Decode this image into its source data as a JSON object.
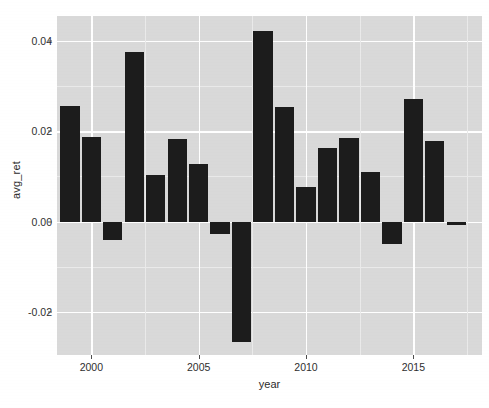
{
  "chart_data": {
    "type": "bar",
    "title": "",
    "subtitle": "",
    "xlabel": "year",
    "ylabel": "avg_ret",
    "categories": [
      1999,
      2000,
      2001,
      2002,
      2003,
      2004,
      2005,
      2006,
      2007,
      2008,
      2009,
      2010,
      2011,
      2012,
      2013,
      2014,
      2015,
      2016,
      2017
    ],
    "values": [
      0.0256,
      0.0187,
      -0.004,
      0.0376,
      0.0104,
      0.0182,
      0.0127,
      -0.0027,
      -0.0267,
      0.0422,
      0.0253,
      0.0076,
      0.0162,
      0.0184,
      0.0109,
      -0.005,
      0.0271,
      0.0178,
      -0.0008
    ],
    "series": [
      {
        "name": "avg_ret",
        "values": [
          0.0256,
          0.0187,
          -0.004,
          0.0376,
          0.0104,
          0.0182,
          0.0127,
          -0.0027,
          -0.0267,
          0.0422,
          0.0253,
          0.0076,
          0.0162,
          0.0184,
          0.0109,
          -0.005,
          0.0271,
          0.0178,
          -0.0008
        ]
      }
    ],
    "xlim": [
      1998.4,
      2018.2
    ],
    "ylim": [
      -0.0295,
      0.0455
    ],
    "y_ticks": [
      -0.02,
      0.0,
      0.02,
      0.04
    ],
    "y_tick_labels": [
      "-0.02",
      "0.00",
      "0.02",
      "0.04"
    ],
    "y_minor_ticks": [
      -0.01,
      0.01,
      0.03
    ],
    "x_ticks": [
      2000,
      2005,
      2010,
      2015
    ],
    "x_tick_labels": [
      "2000",
      "2005",
      "2010",
      "2015"
    ],
    "x_minor_ticks": [
      2002.5,
      2007.5,
      2012.5,
      2017.5
    ],
    "grid": true,
    "legend": "none",
    "bar_color": "#1c1c1c",
    "panel_color": "#d9d9d9",
    "grid_color": "#ffffff",
    "background_color": "#ffffff"
  },
  "axes": {
    "y_title": "avg_ret",
    "x_title": "year"
  }
}
